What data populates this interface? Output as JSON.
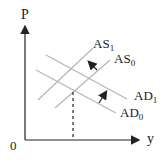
{
  "diagram": {
    "axes": {
      "y_label": "P",
      "x_label": "y",
      "origin_label": "0"
    },
    "curves": [
      {
        "id": "AS1",
        "label_main": "AS",
        "label_sub": "1",
        "type": "supply"
      },
      {
        "id": "AS0",
        "label_main": "AS",
        "label_sub": "0",
        "type": "supply"
      },
      {
        "id": "AD1",
        "label_main": "AD",
        "label_sub": "1",
        "type": "demand"
      },
      {
        "id": "AD0",
        "label_main": "AD",
        "label_sub": "0",
        "type": "demand"
      }
    ],
    "arrows": [
      {
        "from": "AS0",
        "to": "AS1",
        "direction": "up-left"
      },
      {
        "from": "AD0",
        "to": "AD1",
        "direction": "up-right"
      }
    ],
    "colors": {
      "curve": "#b5b5b5",
      "axis": "#222222",
      "text": "#222222"
    }
  }
}
